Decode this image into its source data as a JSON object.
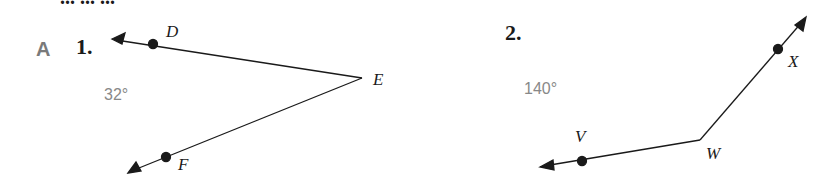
{
  "header": {
    "cut_text": "... ... ..."
  },
  "section": {
    "label": "A"
  },
  "problems": [
    {
      "number": "1.",
      "angle": "32°",
      "vertex": "E",
      "points": [
        "D",
        "F"
      ]
    },
    {
      "number": "2.",
      "angle": "140°",
      "vertex": "W",
      "points": [
        "V",
        "X"
      ]
    }
  ],
  "colors": {
    "ink": "#1a1a1a",
    "gray": "#888888"
  }
}
